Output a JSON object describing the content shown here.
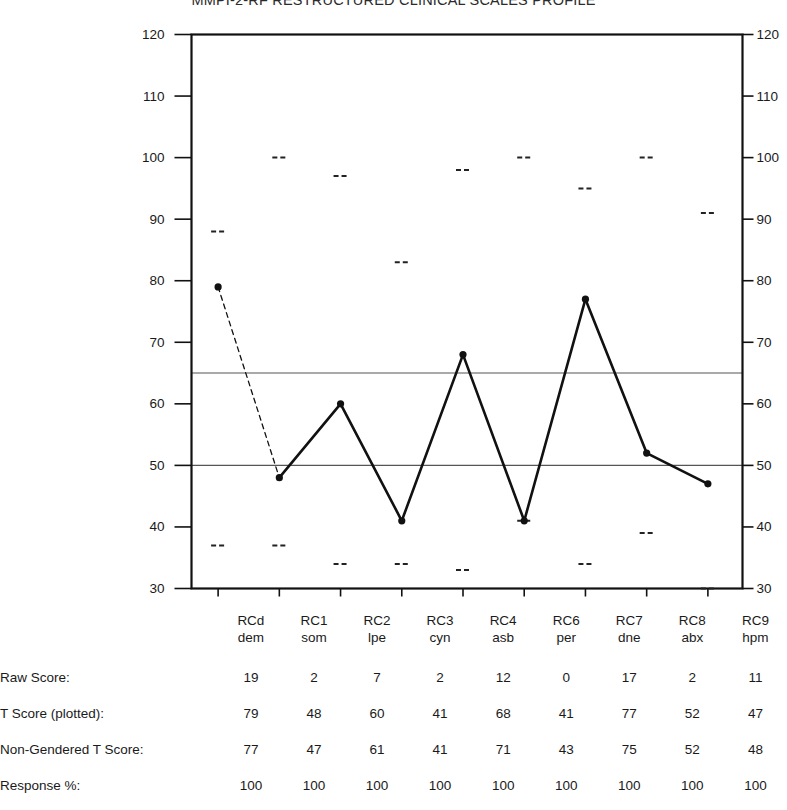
{
  "title": "MMPI-2-RF RESTRUCTURED CLINICAL SCALES PROFILE",
  "axis": {
    "ticks": [
      30,
      40,
      50,
      60,
      70,
      80,
      90,
      100,
      110,
      120
    ],
    "min": 30,
    "max": 120,
    "gridlines": [
      50,
      65
    ],
    "grid_color": "#555555",
    "frame_color": "#111111"
  },
  "scales": [
    {
      "code": "RCd",
      "abbr": "dem"
    },
    {
      "code": "RC1",
      "abbr": "som"
    },
    {
      "code": "RC2",
      "abbr": "lpe"
    },
    {
      "code": "RC3",
      "abbr": "cyn"
    },
    {
      "code": "RC4",
      "abbr": "asb"
    },
    {
      "code": "RC6",
      "abbr": "per"
    },
    {
      "code": "RC7",
      "abbr": "dne"
    },
    {
      "code": "RC8",
      "abbr": "abx"
    },
    {
      "code": "RC9",
      "abbr": "hpm"
    }
  ],
  "rows": [
    {
      "label": "Raw Score:",
      "values": [
        19,
        2,
        7,
        2,
        12,
        0,
        17,
        2,
        11
      ]
    },
    {
      "label": "T Score (plotted):",
      "values": [
        79,
        48,
        60,
        41,
        68,
        41,
        77,
        52,
        47
      ]
    },
    {
      "label": "Non-Gendered T Score:",
      "values": [
        77,
        47,
        61,
        41,
        71,
        43,
        75,
        52,
        48
      ]
    },
    {
      "label": "Response %:",
      "values": [
        100,
        100,
        100,
        100,
        100,
        100,
        100,
        100,
        100
      ]
    }
  ],
  "chart_data": {
    "type": "line",
    "title": "MMPI-2-RF RESTRUCTURED CLINICAL SCALES PROFILE",
    "xlabel": "",
    "ylabel": "T Score",
    "ylim": [
      30,
      120
    ],
    "grid": false,
    "legend": "none",
    "categories": [
      "RCd",
      "RC1",
      "RC2",
      "RC3",
      "RC4",
      "RC6",
      "RC7",
      "RC8",
      "RC9"
    ],
    "category_sublabels": [
      "dem",
      "som",
      "lpe",
      "cyn",
      "asb",
      "per",
      "dne",
      "abx",
      "hpm"
    ],
    "series": [
      {
        "name": "T Score (plotted)",
        "values": [
          79,
          48,
          60,
          41,
          68,
          41,
          77,
          52,
          47
        ],
        "marker": "dot",
        "line_style_segments": [
          "dashed",
          "solid",
          "solid",
          "solid",
          "solid",
          "solid",
          "solid",
          "solid"
        ]
      },
      {
        "name": "Upper comparison marker",
        "values": [
          88,
          100,
          97,
          83,
          98,
          100,
          95,
          100,
          91
        ],
        "marker": "dash",
        "line_style": "none"
      },
      {
        "name": "Lower comparison marker",
        "values": [
          37,
          37,
          34,
          34,
          33,
          41,
          34,
          39,
          30
        ],
        "marker": "dash",
        "line_style": "none"
      }
    ],
    "reference_lines": [
      {
        "y": 65,
        "label": ""
      },
      {
        "y": 50,
        "label": ""
      }
    ],
    "annotations": [
      {
        "text": "Raw Score:",
        "values": [
          19,
          2,
          7,
          2,
          12,
          0,
          17,
          2,
          11
        ]
      },
      {
        "text": "T Score (plotted):",
        "values": [
          79,
          48,
          60,
          41,
          68,
          41,
          77,
          52,
          47
        ]
      },
      {
        "text": "Non-Gendered T Score:",
        "values": [
          77,
          47,
          61,
          41,
          71,
          43,
          75,
          52,
          48
        ]
      },
      {
        "text": "Response %:",
        "values": [
          100,
          100,
          100,
          100,
          100,
          100,
          100,
          100,
          100
        ]
      }
    ]
  }
}
